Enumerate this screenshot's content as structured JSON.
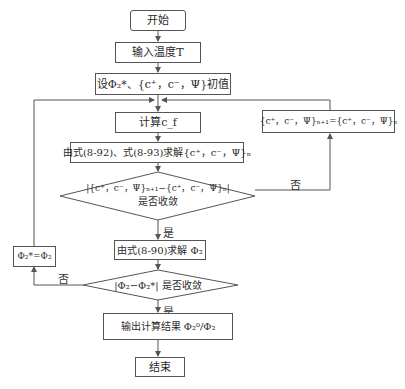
{
  "flowchart": {
    "start": "开始",
    "input_temp": "输入温度T",
    "set_initial": "设Φ₂*、{c⁺，c⁻，Ψ}初值",
    "compute_cf": "计算c_f",
    "update_box": "{c⁺，c⁻，Ψ}ₙ₊₁={c⁺，c⁻，Ψ}ₙ",
    "solve_eq": "由式(8-92)、式(8-93)求解{c⁺，c⁻，Ψ}ₙ",
    "decision1_line1": "|{c⁺，c⁻，Ψ}ₙ₊₁−{c⁺，c⁻，Ψ}ₙ|",
    "decision1_line2": "是否收敛",
    "decision1_no": "否",
    "decision1_yes": "是",
    "solve_phi": "由式(8-90)求解 Φ₂",
    "assign_phi": "Φ₂*=Φ₂",
    "decision2": "|Φ₂−Φ₂*| 是否收敛",
    "decision2_no": "否",
    "decision2_yes": "是",
    "output": "输出计算结果 Φ₂⁰/Φ₂",
    "end": "结束"
  },
  "colors": {
    "line": "#555555",
    "text": "#2a2a2a",
    "background": "#ffffff"
  }
}
